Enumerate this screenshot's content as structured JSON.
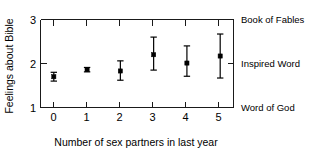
{
  "chart_data": {
    "type": "scatter",
    "title": "",
    "xlabel": "Number of sex partners in last year",
    "ylabel": "Feelings about Bible",
    "x": [
      0,
      1,
      2,
      3,
      4,
      5
    ],
    "values": [
      1.7,
      1.86,
      1.83,
      2.2,
      2.01,
      2.17
    ],
    "error_low": [
      1.6,
      1.81,
      1.62,
      1.85,
      1.71,
      1.67
    ],
    "error_high": [
      1.8,
      1.91,
      2.06,
      2.6,
      2.4,
      2.67
    ],
    "xlim": [
      -0.4,
      5.4
    ],
    "ylim": [
      1,
      3
    ],
    "xticks": [
      "0",
      "1",
      "2",
      "3",
      "4",
      "5"
    ],
    "yticks": [
      "1",
      "2",
      "3"
    ],
    "ytick_values": [
      1,
      2,
      3
    ],
    "category_labels": [
      {
        "value": 3,
        "label": "Book of Fables"
      },
      {
        "value": 2,
        "label": "Inspired Word"
      },
      {
        "value": 1,
        "label": "Word of God"
      }
    ],
    "grid": false,
    "legend": "none",
    "marker_style": "filled-square",
    "errorbar_style": "capped-vertical",
    "series_color": "#000000"
  }
}
